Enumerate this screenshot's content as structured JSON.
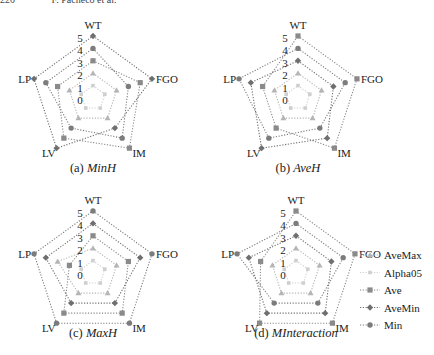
{
  "header": {
    "page_number": "220",
    "running_title": "F. Pacheco et al."
  },
  "axes_order": [
    "WT",
    "FGO",
    "IM",
    "LV",
    "LP"
  ],
  "radial_ticks": [
    "0",
    "1",
    "2",
    "3",
    "4",
    "5"
  ],
  "series_styles": {
    "AveMax": {
      "marker": "triangle",
      "color": "#b5b5b5"
    },
    "Alpha05": {
      "marker": "small-square",
      "color": "#cfcfcf"
    },
    "Ave": {
      "marker": "square",
      "color": "#8a8a8a"
    },
    "AveMin": {
      "marker": "diamond",
      "color": "#6f6f6f"
    },
    "Min": {
      "marker": "circle",
      "color": "#7c7c7c"
    }
  },
  "legend": {
    "position": "right of panel (d)",
    "entries": [
      "AveMax",
      "Alpha05",
      "Ave",
      "AveMin",
      "Min"
    ]
  },
  "chart_data": [
    {
      "type": "radar",
      "title": "(a) MinH",
      "caption_prefix": "(a)",
      "caption_name": "MinH",
      "categories": [
        "WT",
        "FGO",
        "IM",
        "LV",
        "LP"
      ],
      "rlim": [
        0,
        5
      ],
      "series": [
        {
          "name": "AveMax",
          "values": [
            2,
            2,
            2,
            2,
            2
          ]
        },
        {
          "name": "Alpha05",
          "values": [
            1,
            1,
            1,
            1,
            1
          ]
        },
        {
          "name": "Ave",
          "values": [
            3,
            4,
            5,
            4,
            3
          ]
        },
        {
          "name": "AveMin",
          "values": [
            5,
            5,
            3,
            5,
            5
          ]
        },
        {
          "name": "Min",
          "values": [
            4,
            3,
            4,
            3,
            4
          ]
        }
      ]
    },
    {
      "type": "radar",
      "title": "(b) AveH",
      "caption_prefix": "(b)",
      "caption_name": "AveH",
      "categories": [
        "WT",
        "FGO",
        "IM",
        "LV",
        "LP"
      ],
      "rlim": [
        0,
        5
      ],
      "series": [
        {
          "name": "AveMax",
          "values": [
            2,
            2,
            2,
            2,
            2
          ]
        },
        {
          "name": "Alpha05",
          "values": [
            1,
            1,
            1,
            1,
            1
          ]
        },
        {
          "name": "Ave",
          "values": [
            5,
            5,
            5,
            3,
            3
          ]
        },
        {
          "name": "AveMin",
          "values": [
            3,
            3,
            4,
            5,
            4
          ]
        },
        {
          "name": "Min",
          "values": [
            4,
            4,
            3,
            4,
            5
          ]
        }
      ]
    },
    {
      "type": "radar",
      "title": "(c) MaxH",
      "caption_prefix": "(c)",
      "caption_name": "MaxH",
      "categories": [
        "WT",
        "FGO",
        "IM",
        "LV",
        "LP"
      ],
      "rlim": [
        0,
        5
      ],
      "series": [
        {
          "name": "AveMax",
          "values": [
            2,
            2,
            2,
            2,
            3
          ]
        },
        {
          "name": "Alpha05",
          "values": [
            1,
            1,
            1,
            1,
            1
          ]
        },
        {
          "name": "Ave",
          "values": [
            3,
            3,
            4,
            4,
            2
          ]
        },
        {
          "name": "AveMin",
          "values": [
            4,
            4,
            3,
            3,
            4
          ]
        },
        {
          "name": "Min",
          "values": [
            5,
            5,
            5,
            5,
            5
          ]
        }
      ]
    },
    {
      "type": "radar",
      "title": "(d) MInteraction",
      "caption_prefix": "(d)",
      "caption_name": "MInteraction",
      "categories": [
        "WT",
        "FGO",
        "IM",
        "LV",
        "LP"
      ],
      "rlim": [
        0,
        5
      ],
      "series": [
        {
          "name": "AveMax",
          "values": [
            2,
            2,
            2,
            2,
            2
          ]
        },
        {
          "name": "Alpha05",
          "values": [
            1,
            1,
            1,
            1,
            1
          ]
        },
        {
          "name": "Ave",
          "values": [
            5,
            5,
            5,
            5,
            3
          ]
        },
        {
          "name": "AveMin",
          "values": [
            3,
            3,
            4,
            4,
            4
          ]
        },
        {
          "name": "Min",
          "values": [
            4,
            4,
            3,
            3,
            5
          ]
        }
      ]
    }
  ]
}
